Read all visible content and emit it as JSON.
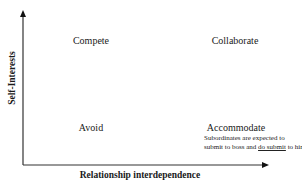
{
  "diagram": {
    "axes": {
      "x_label": "Relationship interdependence",
      "y_label": "Self-Interests"
    },
    "quadrants": {
      "top_left": "Compete",
      "top_right": "Collaborate",
      "bottom_left": "Avoid",
      "bottom_right": "Accommodate"
    },
    "note": {
      "line1": "Subordinates are expected to",
      "line2_pre": "submit to boss and ",
      "line2_emph": "do submit",
      "line2_post": " to him"
    },
    "colors": {
      "axis": "#333333",
      "text": "#1a1a1a",
      "background": "#ffffff"
    }
  }
}
